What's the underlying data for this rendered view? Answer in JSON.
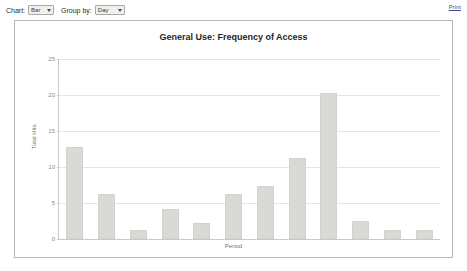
{
  "toolbar": {
    "chart_label": "Chart:",
    "chart_type_value": "Bar",
    "group_by_label": "Group by:",
    "group_by_value": "Day",
    "print_link": "Print"
  },
  "chart_data": {
    "type": "bar",
    "title": "General Use: Frequency of Access",
    "xlabel": "Period",
    "ylabel": "Total Hits",
    "ylim": [
      0,
      25
    ],
    "yticks": [
      0,
      5,
      10,
      15,
      20,
      25
    ],
    "grid": true,
    "legend": null,
    "categories": [
      "1",
      "2",
      "3",
      "4",
      "5",
      "6",
      "7",
      "8",
      "9",
      "10",
      "11",
      "12"
    ],
    "values": [
      12.8,
      6.2,
      1.2,
      4.2,
      2.2,
      6.3,
      7.3,
      11.3,
      20.3,
      2.5,
      1.3,
      1.3
    ],
    "bar_color": "#d9d9d5"
  }
}
